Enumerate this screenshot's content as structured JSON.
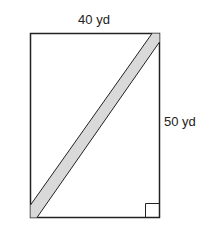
{
  "diagram": {
    "type": "rectangle with diagonal path",
    "labels": {
      "top_width": "40 yd",
      "right_height": "50 yd"
    },
    "colors": {
      "stroke": "#222222",
      "band_fill": "#d9d9d9",
      "background": "#ffffff"
    },
    "right_angle_marker": "bottom-right"
  }
}
